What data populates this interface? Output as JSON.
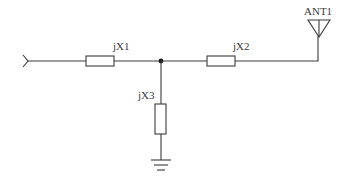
{
  "diagram": {
    "type": "circuit-schematic",
    "components": [
      {
        "id": "jX1",
        "label": "jX1",
        "kind": "reactance",
        "orientation": "horizontal",
        "position": "series-input"
      },
      {
        "id": "jX2",
        "label": "jX2",
        "kind": "reactance",
        "orientation": "horizontal",
        "position": "series-output"
      },
      {
        "id": "jX3",
        "label": "jX3",
        "kind": "reactance",
        "orientation": "vertical",
        "position": "shunt-to-ground"
      },
      {
        "id": "ANT1",
        "label": "ANT1",
        "kind": "antenna"
      }
    ],
    "labels": {
      "jx1": "jX1",
      "jx2": "jX2",
      "jx3": "jX3",
      "antenna": "ANT1"
    },
    "nodes": [
      {
        "name": "input",
        "symbol": "port-arrow"
      },
      {
        "name": "junction",
        "symbol": "dot"
      },
      {
        "name": "ground",
        "symbol": "ground"
      }
    ],
    "colors": {
      "line": "#3a3a3a",
      "background": "#ffffff"
    }
  }
}
